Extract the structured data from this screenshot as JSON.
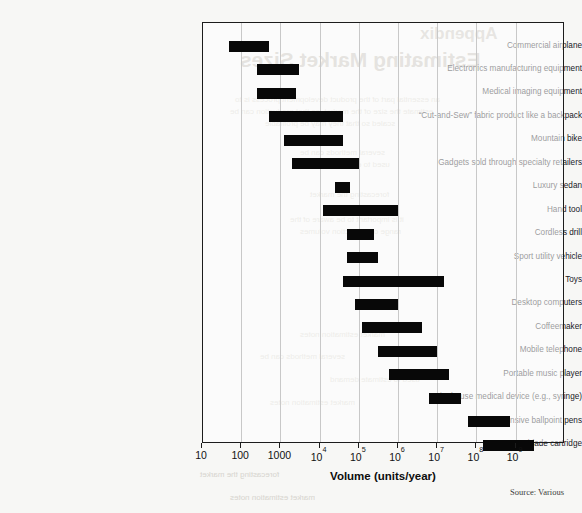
{
  "source_note": "Source: Various",
  "bleed_through": {
    "appendix_label": "Appendix",
    "chapter_title": "Estimating Market Sizes",
    "body_lines": [
      "an essential part of the product development process is to",
      "estimate the size of the market, so that production can be",
      "scaled so that they may be profitable",
      "",
      "several methods can be",
      "used to estimate demand",
      "",
      "forecasting the market",
      "",
      "it is important to be aware of the",
      "range of production volumes"
    ]
  },
  "chart_data": {
    "type": "bar",
    "orientation": "horizontal",
    "subtype": "range-bar",
    "title": "",
    "xlabel": "Volume (units/year)",
    "ylabel": "",
    "xscale": "log",
    "xlim": [
      10,
      5000000000
    ],
    "grid": "vertical",
    "legend": "none",
    "tick_values": [
      10,
      100,
      1000,
      10000,
      100000,
      1000000,
      10000000,
      100000000,
      1000000000
    ],
    "tick_labels": [
      "10",
      "100",
      "1000",
      "10⁴",
      "10⁵",
      "10⁶",
      "10⁷",
      "10⁸",
      "10⁹"
    ],
    "tick_labels_html": [
      "10",
      "100",
      "1000",
      "10<sup>4</sup>",
      "10<sup>5</sup>",
      "10<sup>6</sup>",
      "10<sup>7</sup>",
      "10<sup>8</sup>",
      "10<sup>9</sup>"
    ],
    "bar_color": "#080808",
    "categories": [
      "Commercial airplane",
      "Electronics manufacturing equipment",
      "Medical imaging equipment",
      "“Cut-and-Sew” fabric product like a backpack",
      "Mountain bike",
      "Gadgets sold through specialty retailers",
      "Luxury sedan",
      "Hand tool",
      "Cordless drill",
      "Sport utility vehicle",
      "Toys",
      "Desktop computers",
      "Coffeemaker",
      "Mobile telephone",
      "Portable music player",
      "Single-use medical device (e.g., syringe)",
      "Inexpensive ballpoint pens",
      "Razor blade cartridge"
    ],
    "ranges": [
      {
        "label": "Commercial airplane",
        "low": 50,
        "high": 500
      },
      {
        "label": "Electronics manufacturing equipment",
        "low": 250,
        "high": 3000
      },
      {
        "label": "Medical imaging equipment",
        "low": 250,
        "high": 2500
      },
      {
        "label": "“Cut-and-Sew” fabric product like a backpack",
        "low": 500,
        "high": 40000
      },
      {
        "label": "Mountain bike",
        "low": 1200,
        "high": 40000
      },
      {
        "label": "Gadgets sold through specialty retailers",
        "low": 2000,
        "high": 100000
      },
      {
        "label": "Luxury sedan",
        "low": 25000,
        "high": 60000
      },
      {
        "label": "Hand tool",
        "low": 12000,
        "high": 1000000
      },
      {
        "label": "Cordless drill",
        "low": 50000,
        "high": 250000
      },
      {
        "label": "Sport utility vehicle",
        "low": 50000,
        "high": 300000
      },
      {
        "label": "Toys",
        "low": 40000,
        "high": 15000000
      },
      {
        "label": "Desktop computers",
        "low": 80000,
        "high": 1000000
      },
      {
        "label": "Coffeemaker",
        "low": 120000,
        "high": 4000000
      },
      {
        "label": "Mobile telephone",
        "low": 300000,
        "high": 10000000
      },
      {
        "label": "Portable music player",
        "low": 600000,
        "high": 20000000
      },
      {
        "label": "Single-use medical device (e.g., syringe)",
        "low": 6000000,
        "high": 40000000
      },
      {
        "label": "Inexpensive ballpoint pens",
        "low": 60000000,
        "high": 700000000
      },
      {
        "label": "Razor blade cartridge",
        "low": 150000000,
        "high": 3000000000
      }
    ]
  }
}
